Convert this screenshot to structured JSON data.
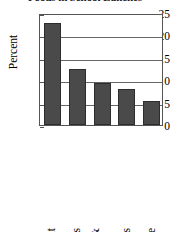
{
  "chart_data": {
    "type": "bar",
    "title": "Foods in School Lunches",
    "xlabel": "",
    "ylabel": "Percent",
    "ylim": [
      0,
      25
    ],
    "yticks": [
      0,
      5,
      10,
      15,
      20,
      25
    ],
    "ytick_labels": [
      "0",
      "5",
      "10",
      "15",
      "20",
      "25"
    ],
    "grid": true,
    "legend": null,
    "categories": [
      "Fruit",
      "Cookies",
      "Peanut butter & jelly sandwich",
      "Potato chips",
      "Cake"
    ],
    "category_lines": [
      [
        "Fruit"
      ],
      [
        "Cookies"
      ],
      [
        "Peanut butter &",
        "jelly sandwich"
      ],
      [
        "Potato chips"
      ],
      [
        "Cake"
      ]
    ],
    "values": [
      22.7,
      12.6,
      9.4,
      8.1,
      5.4
    ],
    "bar_color": "#4a4a4a",
    "bar_edge_color": "#2d2d2d",
    "axis_color": "#555555",
    "grid_color": "#666666",
    "background": "#ffffff"
  }
}
